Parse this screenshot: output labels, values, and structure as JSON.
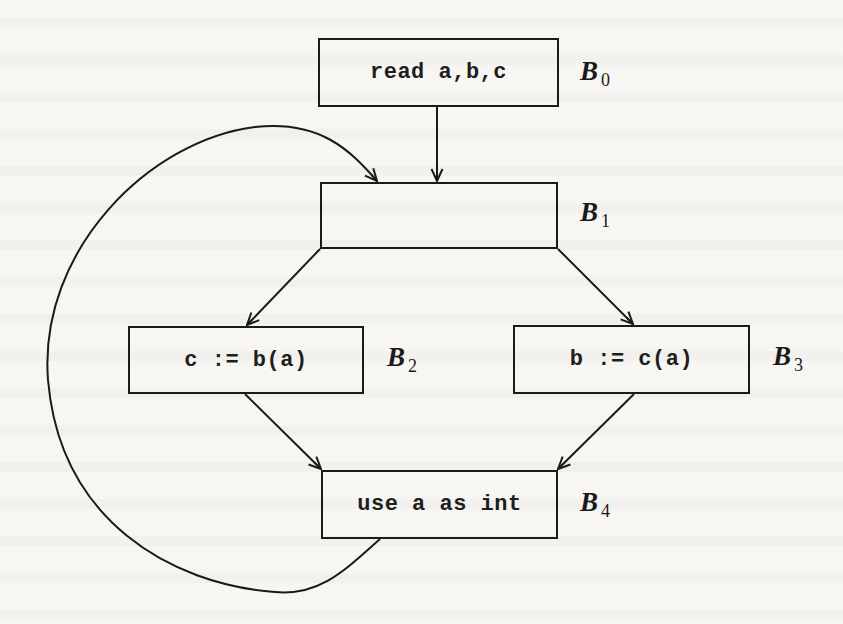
{
  "diagram": {
    "type": "control-flow-graph",
    "colors": {
      "background": "#f7f6f2",
      "stroke": "#1a1a1a",
      "text": "#1e1e1e"
    },
    "blocks": [
      {
        "id": "B0",
        "label_letter": "B",
        "label_sub": "0",
        "code": "read a,b,c",
        "x": 318,
        "y": 38,
        "w": 241,
        "h": 69
      },
      {
        "id": "B1",
        "label_letter": "B",
        "label_sub": "1",
        "code": "",
        "x": 320,
        "y": 182,
        "w": 238,
        "h": 67
      },
      {
        "id": "B2",
        "label_letter": "B",
        "label_sub": "2",
        "code": "c := b(a)",
        "x": 128,
        "y": 326,
        "w": 236,
        "h": 68
      },
      {
        "id": "B3",
        "label_letter": "B",
        "label_sub": "3",
        "code": "b := c(a)",
        "x": 513,
        "y": 325,
        "w": 237,
        "h": 69
      },
      {
        "id": "B4",
        "label_letter": "B",
        "label_sub": "4",
        "code": "use a as int",
        "x": 321,
        "y": 470,
        "w": 237,
        "h": 69
      }
    ],
    "labels_pos": [
      {
        "x": 580,
        "y": 58
      },
      {
        "x": 580,
        "y": 199
      },
      {
        "x": 387,
        "y": 344
      },
      {
        "x": 773,
        "y": 343
      },
      {
        "x": 580,
        "y": 489
      }
    ],
    "edges": [
      {
        "from": "B0",
        "to": "B1",
        "kind": "straight"
      },
      {
        "from": "B1",
        "to": "B2",
        "kind": "straight"
      },
      {
        "from": "B1",
        "to": "B3",
        "kind": "straight"
      },
      {
        "from": "B2",
        "to": "B4",
        "kind": "straight"
      },
      {
        "from": "B3",
        "to": "B4",
        "kind": "straight"
      },
      {
        "from": "B4",
        "to": "B1",
        "kind": "back-edge-curve"
      }
    ]
  }
}
